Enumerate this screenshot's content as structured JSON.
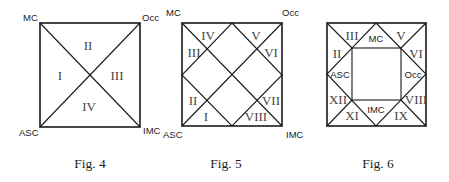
{
  "figures": [
    {
      "caption": "Fig. 4",
      "corners": {
        "top_left": "MC",
        "top_right": "Occ",
        "bottom_left": "ASC",
        "bottom_right": "IMC"
      },
      "houses": {
        "left": "I",
        "top": "II",
        "right": "III",
        "bottom": "IV"
      }
    },
    {
      "caption": "Fig. 5",
      "corners": {
        "top_left": "MC",
        "top_right": "Occ",
        "bottom_left": "ASC",
        "bottom_right": "IMC"
      },
      "houses": {
        "h1": "I",
        "h2": "II",
        "h3": "III",
        "h4": "IV",
        "h5": "V",
        "h6": "VI",
        "h7": "VII",
        "h8": "VIII"
      }
    },
    {
      "caption": "Fig. 6",
      "inner": {
        "top": "MC",
        "left": "ASC",
        "right": "Occ",
        "bottom": "IMC"
      },
      "houses": {
        "h2": "II",
        "h3": "III",
        "h5": "V",
        "h6": "VI",
        "h8": "VIII",
        "h9": "IX",
        "h11": "XI",
        "h12": "XII"
      }
    }
  ]
}
